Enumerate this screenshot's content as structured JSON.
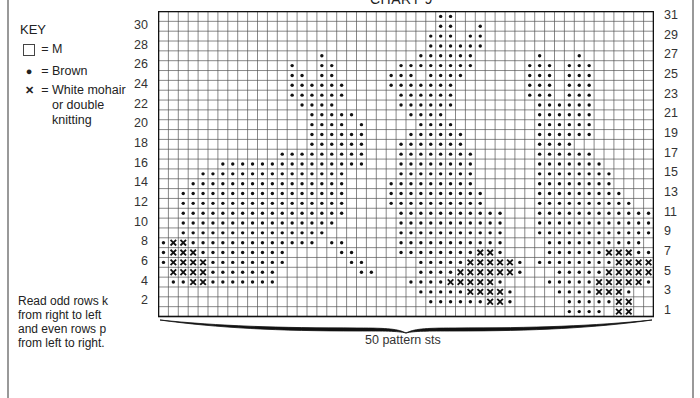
{
  "title": "CHART 9",
  "key": {
    "heading": "KEY",
    "items": [
      {
        "symbol": "box",
        "label": "M"
      },
      {
        "symbol": "dot",
        "label": "Brown"
      },
      {
        "symbol": "cross",
        "label": "White mohair\nor double\nknitting"
      }
    ],
    "equals": "="
  },
  "instructions": "Read odd rows k\nfrom right to left\nand even rows p\nfrom left to right.",
  "left_row_labels": [
    "30",
    "28",
    "26",
    "24",
    "22",
    "20",
    "18",
    "16",
    "14",
    "12",
    "10",
    "8",
    "6",
    "4",
    "2"
  ],
  "right_row_labels": [
    "31",
    "29",
    "27",
    "25",
    "23",
    "21",
    "19",
    "17",
    "15",
    "13",
    "11",
    "9",
    "7",
    "5",
    "3",
    "1"
  ],
  "stitch_count_label": "50 pattern sts",
  "chart": {
    "columns": 50,
    "rows": 31,
    "legend": {
      ".": "M",
      "o": "Brown",
      "x": "White mohair or double knitting"
    },
    "grid_top_to_bottom": [
      "............................oo....................",
      "............................oo..o.................",
      "...........................ooo.oo.................",
      "...........................oooooo.................",
      "................o.........oooooo......o...o.......",
      ".............o..oo......oooooooo.....ooo.ooo......",
      ".............oo.oo.....ooo.oooo......ooo.ooo......",
      ".............oooooo....ooooooo.......ooo.ooo......",
      ".............oooooo.....oooooo.......ooo.ooo......",
      "..............oooo......oooooo........oooooo......",
      "...............ooooo.....oooo.........oooooo......",
      "...............oooo.o.....oooo........oooooo......",
      "...............oooooo....oooooo.......oooooo......",
      "...............oooooo...ooooooo.......oooo........",
      "............ooooooooo...oooooooo......oooooo......",
      "......ooooooooooooooo...oooooooo......ooooooo.....",
      "....ooooooooooooooo.....oooooooo......oooooooo....",
      "...oooooooooooooooo....ooooooooo......oooooooo....",
      "..ooooooooooooooooo....oooooooooo.....ooooooooo...",
      "..ooooooooooooooooo....oooooooooo.....oooooooooo..",
      "..ooooooooooooooooo.....ooooooooooo...oooooooooooo",
      "..oooooooooooooooo......ooooooooooo...oooooooooooo",
      "..ooooooooooooooo.......ooooooooooo...oooooooooooo",
      "oxxooooooooooooo.oo.....ooooooooooo....oooooooooo.",
      "oxxxooooooooo.....oo....ooooooooxxo....ooooooxxxoo",
      "oxxxxoooooooo......oo.....oooooxxxxxo.ooooooooxxxxx",
      ".xxxxooooooo........oo....ooooxxxxxxo...oooooxxxxxo",
      ".ooxxooooooo.............ooooxxxxxo....oooooxxxxxo.",
      "..........................oooooxxxxo....ooooxxxo..",
      "...........................ooooooxxo.....oooooxx..",
      ".........................................oooo.xx..."
    ]
  }
}
